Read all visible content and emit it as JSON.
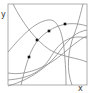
{
  "diagram": {
    "axis_labels": {
      "x": "x",
      "y": "y"
    },
    "colors": {
      "frame": "#9a9a9a",
      "curve": "#8a8a8a",
      "point": "#111111",
      "label": "#333333"
    },
    "frame": {
      "x": 8,
      "y": 4,
      "width": 79,
      "height": 81
    },
    "curves": [
      {
        "id": "curve-1",
        "d": "M13,4 C22,22 35,40 50,50 C62,57 78,58 87,62"
      },
      {
        "id": "curve-2",
        "d": "M21,85 C26,65 30,48 40,38 C52,26 68,20 87,26"
      },
      {
        "id": "curve-3",
        "d": "M72,85 C66,70 68,50 74,35 C78,24 81,12 83,4"
      },
      {
        "id": "curve-4",
        "d": "M8,52 C20,38 34,22 48,20 C60,18 64,40 65,60 C66,72 66,80 66,85"
      },
      {
        "id": "curve-5",
        "d": "M8,80 C30,78 42,72 52,55 C60,42 70,34 87,38"
      },
      {
        "id": "curve-6",
        "d": "M8,73 C25,76 45,68 60,56 C70,48 78,40 87,36"
      },
      {
        "id": "curve-7",
        "d": "M8,86 C30,80 50,66 62,48 C70,38 76,32 87,30"
      }
    ],
    "points": [
      {
        "x": 29,
        "y": 57
      },
      {
        "x": 37,
        "y": 40
      },
      {
        "x": 49,
        "y": 31
      },
      {
        "x": 65,
        "y": 24
      }
    ]
  }
}
